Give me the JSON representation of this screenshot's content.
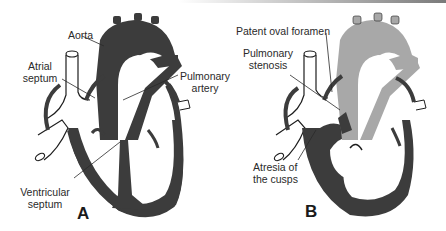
{
  "figure": {
    "panels": [
      {
        "letter": "A",
        "labels": {
          "aorta": "Aorta",
          "atrial_septum": [
            "Atrial",
            "septum"
          ],
          "pulmonary_artery": [
            "Pulmonary",
            "artery"
          ],
          "ventricular_septum": [
            "Ventricular",
            "septum"
          ]
        }
      },
      {
        "letter": "B",
        "labels": {
          "patent_oval_foramen": "Patent oval foramen",
          "pulmonary_stenosis": [
            "Pulmonary",
            "stenosis"
          ],
          "atresia_of_cusps": [
            "Atresia of",
            "the cusps"
          ]
        }
      }
    ],
    "colors": {
      "dark_fill": "#3c3c3c",
      "light_fill": "#a8a8a8",
      "outline": "#1e1e1e",
      "background": "#ffffff"
    }
  }
}
